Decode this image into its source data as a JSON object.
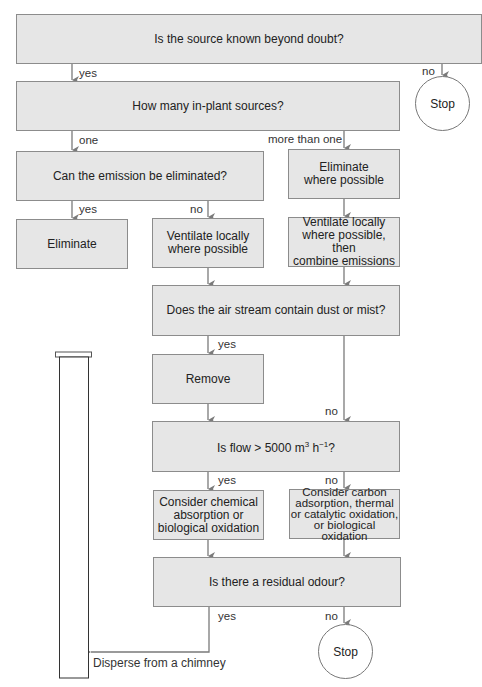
{
  "diagram": {
    "nodes": {
      "source_known": "Is the source known beyond doubt?",
      "how_many": "How many in-plant sources?",
      "stop_top": "Stop",
      "can_eliminate": "Can the emission be eliminated?",
      "eliminate_where_possible": "Eliminate\nwhere possible",
      "eliminate": "Eliminate",
      "ventilate_locally": "Ventilate locally\nwhere possible",
      "ventilate_combine": "Ventilate locally\nwhere possible, then\ncombine emissions",
      "dust_mist": "Does the air stream contain dust or mist?",
      "remove": "Remove",
      "flow_prefix": "Is flow > 5000 m",
      "flow_sup1": "3",
      "flow_mid": " h",
      "flow_sup2": "−1",
      "flow_suffix": "?",
      "chemical": "Consider chemical\nabsorption or\nbiological oxidation",
      "carbon": "Consider carbon\nadsorption, thermal\nor catalytic oxidation,\nor biological oxidation",
      "residual_odour": "Is there a residual odour?",
      "stop_bottom": "Stop",
      "disperse": "Disperse from a chimney"
    },
    "edge_labels": {
      "src_yes": "yes",
      "src_no": "no",
      "one": "one",
      "more_than_one": "more than one",
      "elim_yes": "yes",
      "elim_no": "no",
      "dust_yes": "yes",
      "dust_no": "no",
      "flow_yes": "yes",
      "flow_no": "no",
      "odour_yes": "yes",
      "odour_no": "no"
    },
    "colors": {
      "box_fill": "#e6e6e6",
      "box_border": "#8c8c8c",
      "arrow": "#7a7a7a"
    }
  }
}
